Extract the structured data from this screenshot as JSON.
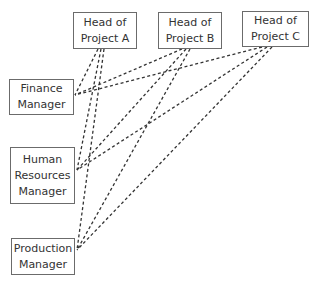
{
  "diagram": {
    "type": "relationship-diagram",
    "line_style": "dashed",
    "line_color": "#333333",
    "project_heads": [
      {
        "id": "A",
        "lines": [
          "Head of",
          "Project A"
        ],
        "x": 73,
        "y": 12,
        "w": 64,
        "h": 37
      },
      {
        "id": "B",
        "lines": [
          "Head of",
          "Project B"
        ],
        "x": 158,
        "y": 12,
        "w": 64,
        "h": 37
      },
      {
        "id": "C",
        "lines": [
          "Head of",
          "Project C"
        ],
        "x": 242,
        "y": 11,
        "w": 67,
        "h": 36
      }
    ],
    "managers": [
      {
        "id": "finance",
        "lines": [
          "Finance",
          "Manager"
        ],
        "x": 9,
        "y": 79,
        "w": 65,
        "h": 36
      },
      {
        "id": "hr",
        "lines": [
          "Human",
          "Resources",
          "Manager"
        ],
        "x": 10,
        "y": 147,
        "w": 65,
        "h": 57
      },
      {
        "id": "production",
        "lines": [
          "Production",
          "Manager"
        ],
        "x": 11,
        "y": 238,
        "w": 64,
        "h": 37
      }
    ],
    "connections": [
      {
        "from": "A",
        "to": "finance",
        "x1": 98,
        "y1": 49,
        "x2": 75,
        "y2": 95
      },
      {
        "from": "A",
        "to": "hr",
        "x1": 101,
        "y1": 49,
        "x2": 77,
        "y2": 170
      },
      {
        "from": "A",
        "to": "production",
        "x1": 104,
        "y1": 49,
        "x2": 77,
        "y2": 250
      },
      {
        "from": "B",
        "to": "finance",
        "x1": 182,
        "y1": 49,
        "x2": 75,
        "y2": 95
      },
      {
        "from": "B",
        "to": "hr",
        "x1": 186,
        "y1": 49,
        "x2": 77,
        "y2": 170
      },
      {
        "from": "B",
        "to": "production",
        "x1": 190,
        "y1": 49,
        "x2": 77,
        "y2": 250
      },
      {
        "from": "C",
        "to": "finance",
        "x1": 262,
        "y1": 47,
        "x2": 75,
        "y2": 95
      },
      {
        "from": "C",
        "to": "hr",
        "x1": 267,
        "y1": 47,
        "x2": 77,
        "y2": 170
      },
      {
        "from": "C",
        "to": "production",
        "x1": 272,
        "y1": 47,
        "x2": 77,
        "y2": 250
      }
    ]
  }
}
